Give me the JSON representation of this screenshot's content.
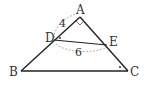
{
  "diagram": {
    "type": "geometry-triangle",
    "points": {
      "A": {
        "label": "A",
        "x": 80,
        "y": 17
      },
      "B": {
        "label": "B",
        "x": 21,
        "y": 71
      },
      "C": {
        "label": "C",
        "x": 128,
        "y": 71
      },
      "D": {
        "label": "D",
        "x": 54,
        "y": 40
      },
      "E": {
        "label": "E",
        "x": 107,
        "y": 45
      }
    },
    "segments": [
      {
        "from": "A",
        "to": "B"
      },
      {
        "from": "A",
        "to": "C"
      },
      {
        "from": "B",
        "to": "C"
      },
      {
        "from": "D",
        "to": "E"
      }
    ],
    "measurements": {
      "AD": "4",
      "DE_arc": "6"
    },
    "markers": {
      "right_angle_at": "A",
      "equal_angle_dots": [
        "D",
        "C"
      ]
    },
    "colors": {
      "line": "#222222",
      "dashed": "#999999",
      "text": "#333333"
    }
  }
}
